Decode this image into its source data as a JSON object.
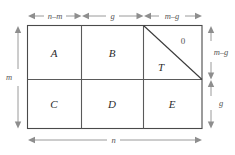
{
  "figure": {
    "background_color": "#ffffff",
    "line_color": "#4a4a4a",
    "dimension_color": "#8e8e8e",
    "label_color": "#2b2b2b"
  },
  "regions": [
    {
      "id": "A",
      "label": "A",
      "row": "top",
      "column": "left"
    },
    {
      "id": "B",
      "label": "B",
      "row": "top",
      "column": "middle"
    },
    {
      "id": "T",
      "label": "T",
      "row": "top",
      "column": "right"
    },
    {
      "id": "C",
      "label": "C",
      "row": "bottom",
      "column": "left"
    },
    {
      "id": "D",
      "label": "D",
      "row": "bottom",
      "column": "middle"
    },
    {
      "id": "E",
      "label": "E",
      "row": "bottom",
      "column": "right"
    }
  ],
  "annotations": {
    "zero_label": "0"
  },
  "dimensions": {
    "top": [
      {
        "id": "top-left-span",
        "label": "n–m"
      },
      {
        "id": "top-middle-span",
        "label": "g"
      },
      {
        "id": "top-right-span",
        "label": "m–g"
      }
    ],
    "right": [
      {
        "id": "right-upper-span",
        "label": "m–g"
      },
      {
        "id": "right-lower-span",
        "label": "g"
      }
    ],
    "left": [
      {
        "id": "left-total-span",
        "label": "m"
      }
    ],
    "bottom": [
      {
        "id": "bottom-total-span",
        "label": "n"
      }
    ]
  }
}
